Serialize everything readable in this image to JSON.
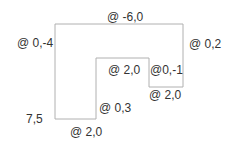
{
  "diagram": {
    "type": "polyline-coordinate-diagram",
    "start_point": "7,5",
    "segments": [
      {
        "label": "@ 0,-4",
        "dir": "up"
      },
      {
        "label": "@ -6,0",
        "dir": "top"
      },
      {
        "label": "@ 0,2",
        "dir": "right-down"
      },
      {
        "label": "@ 2,0",
        "dir": "inner-bottom"
      },
      {
        "label": "@0,-1",
        "dir": "inner-up"
      },
      {
        "label": "@ 2,0",
        "dir": "inner-top"
      },
      {
        "label": "@ 0,3",
        "dir": "inner-down"
      },
      {
        "label": "@ 2,0",
        "dir": "bottom"
      }
    ],
    "line_color": "#b0b0b0",
    "text_color": "#333333"
  }
}
